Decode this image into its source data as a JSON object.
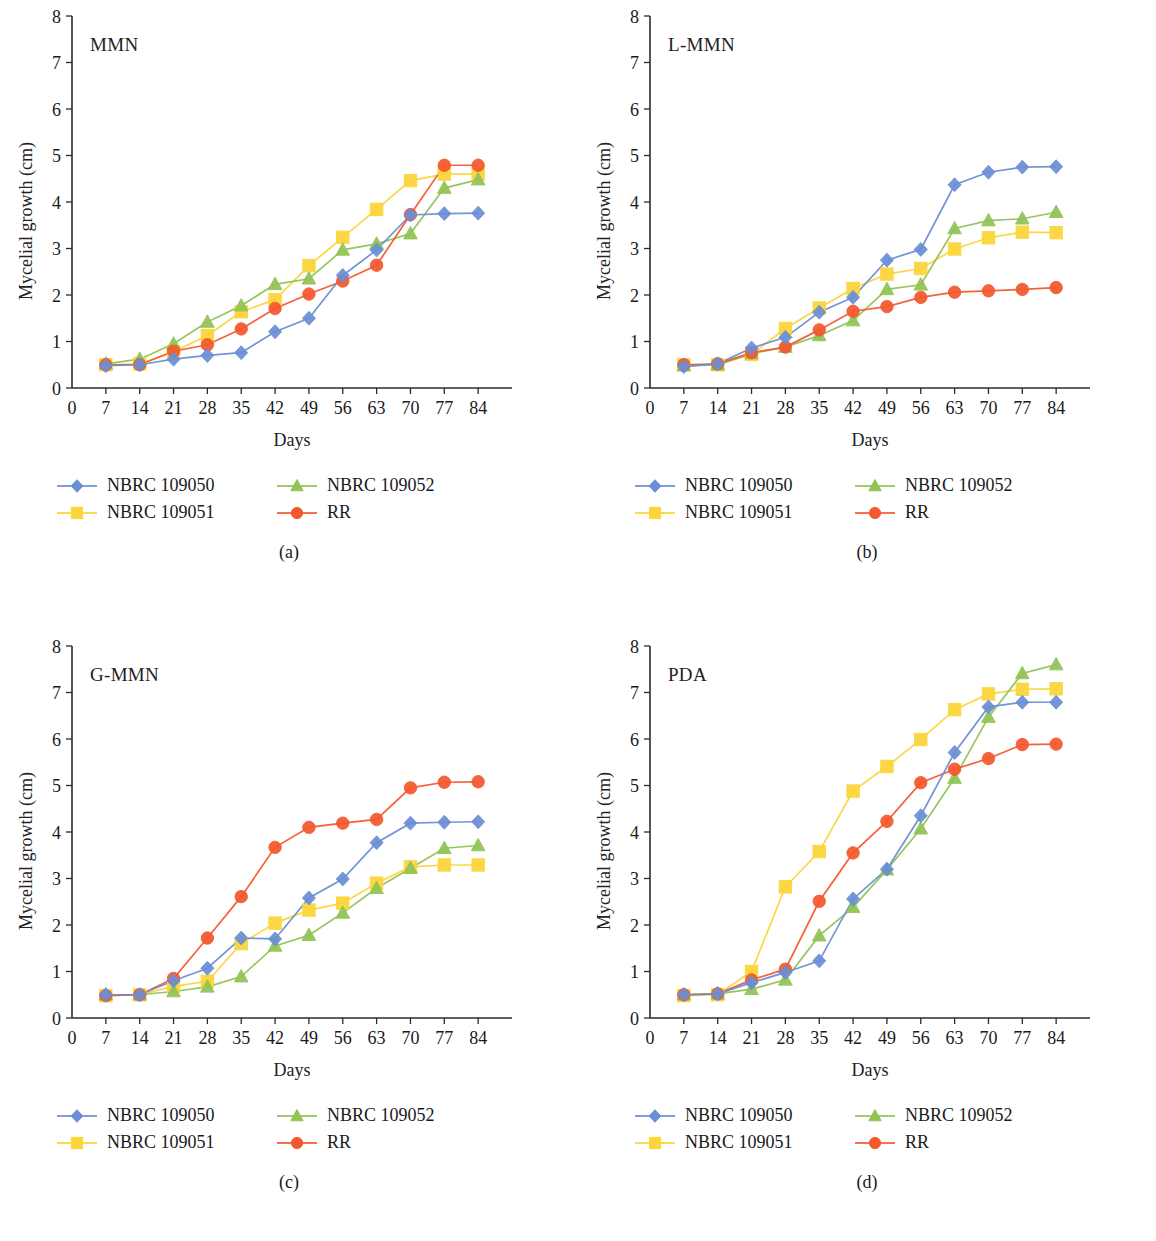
{
  "figure": {
    "axis_titles": {
      "x": "Days",
      "y": "Mycelial growth (cm)"
    },
    "legend_labels": {
      "s0": "NBRC 109050",
      "s1": "NBRC 109051",
      "s2": "NBRC 109052",
      "s3": "RR"
    },
    "colors": {
      "s0": "#6b8fd4",
      "s1": "#fbd539",
      "s2": "#91c355",
      "s3": "#f4582d",
      "axis": "#2b2b2b",
      "text": "#1a1a1a"
    },
    "captions": {
      "a": "(a)",
      "b": "(b)",
      "c": "(c)",
      "d": "(d)"
    }
  },
  "chart_data": [
    {
      "type": "line",
      "panel": "a",
      "title": "MMN",
      "xlabel": "Days",
      "ylabel": "Mycelial growth (cm)",
      "xlim": [
        0,
        91
      ],
      "ylim": [
        0,
        8
      ],
      "xticks": [
        0,
        7,
        14,
        21,
        28,
        35,
        42,
        49,
        56,
        63,
        70,
        77,
        84
      ],
      "yticks": [
        0,
        1,
        2,
        3,
        4,
        5,
        6,
        7,
        8
      ],
      "grid": false,
      "legend_position": "below",
      "x": [
        7,
        14,
        21,
        28,
        35,
        42,
        49,
        56,
        63,
        70,
        77,
        84
      ],
      "series": [
        {
          "name": "NBRC 109050",
          "marker": "diamond",
          "color": "#6b8fd4",
          "values": [
            0.48,
            0.5,
            0.62,
            0.7,
            0.76,
            1.21,
            1.5,
            2.42,
            2.97,
            3.72,
            3.75,
            3.76
          ]
        },
        {
          "name": "NBRC 109051",
          "marker": "square",
          "color": "#fbd539",
          "values": [
            0.5,
            0.52,
            0.78,
            1.13,
            1.64,
            1.9,
            2.63,
            3.24,
            3.84,
            4.46,
            4.6,
            4.6
          ]
        },
        {
          "name": "NBRC 109052",
          "marker": "triangle",
          "color": "#91c355",
          "values": [
            0.52,
            0.62,
            0.95,
            1.42,
            1.77,
            2.23,
            2.35,
            2.97,
            3.1,
            3.32,
            4.3,
            4.48
          ]
        },
        {
          "name": "RR",
          "marker": "circle",
          "color": "#f4582d",
          "values": [
            0.5,
            0.5,
            0.79,
            0.93,
            1.27,
            1.71,
            2.02,
            2.3,
            2.64,
            3.73,
            4.79,
            4.79
          ]
        }
      ]
    },
    {
      "type": "line",
      "panel": "b",
      "title": "L-MMN",
      "xlabel": "Days",
      "ylabel": "Mycelial growth (cm)",
      "xlim": [
        0,
        91
      ],
      "ylim": [
        0,
        8
      ],
      "xticks": [
        0,
        7,
        14,
        21,
        28,
        35,
        42,
        49,
        56,
        63,
        70,
        77,
        84
      ],
      "yticks": [
        0,
        1,
        2,
        3,
        4,
        5,
        6,
        7,
        8
      ],
      "grid": false,
      "legend_position": "below",
      "x": [
        7,
        14,
        21,
        28,
        35,
        42,
        49,
        56,
        63,
        70,
        77,
        84
      ],
      "series": [
        {
          "name": "NBRC 109050",
          "marker": "diamond",
          "color": "#6b8fd4",
          "values": [
            0.46,
            0.52,
            0.86,
            1.09,
            1.63,
            1.95,
            2.75,
            2.98,
            4.37,
            4.64,
            4.75,
            4.76
          ]
        },
        {
          "name": "NBRC 109051",
          "marker": "square",
          "color": "#fbd539",
          "values": [
            0.5,
            0.5,
            0.72,
            1.28,
            1.72,
            2.14,
            2.45,
            2.57,
            2.99,
            3.23,
            3.35,
            3.34
          ]
        },
        {
          "name": "NBRC 109052",
          "marker": "triangle",
          "color": "#91c355",
          "values": [
            0.48,
            0.5,
            0.74,
            0.88,
            1.13,
            1.45,
            2.12,
            2.22,
            3.43,
            3.6,
            3.64,
            3.78
          ]
        },
        {
          "name": "RR",
          "marker": "circle",
          "color": "#f4582d",
          "values": [
            0.5,
            0.52,
            0.76,
            0.88,
            1.25,
            1.65,
            1.75,
            1.95,
            2.06,
            2.09,
            2.12,
            2.16
          ]
        }
      ]
    },
    {
      "type": "line",
      "panel": "c",
      "title": "G-MMN",
      "xlabel": "Days",
      "ylabel": "Mycelial growth (cm)",
      "xlim": [
        0,
        91
      ],
      "ylim": [
        0,
        8
      ],
      "xticks": [
        0,
        7,
        14,
        21,
        28,
        35,
        42,
        49,
        56,
        63,
        70,
        77,
        84
      ],
      "yticks": [
        0,
        1,
        2,
        3,
        4,
        5,
        6,
        7,
        8
      ],
      "grid": false,
      "legend_position": "below",
      "x": [
        7,
        14,
        21,
        28,
        35,
        42,
        49,
        56,
        63,
        70,
        77,
        84
      ],
      "series": [
        {
          "name": "NBRC 109050",
          "marker": "diamond",
          "color": "#6b8fd4",
          "values": [
            0.5,
            0.5,
            0.8,
            1.07,
            1.72,
            1.7,
            2.58,
            2.99,
            3.77,
            4.19,
            4.21,
            4.22
          ]
        },
        {
          "name": "NBRC 109051",
          "marker": "square",
          "color": "#fbd539",
          "values": [
            0.48,
            0.5,
            0.68,
            0.79,
            1.6,
            2.04,
            2.32,
            2.47,
            2.9,
            3.25,
            3.29,
            3.29
          ]
        },
        {
          "name": "NBRC 109052",
          "marker": "triangle",
          "color": "#91c355",
          "values": [
            0.5,
            0.5,
            0.57,
            0.67,
            0.89,
            1.55,
            1.78,
            2.26,
            2.79,
            3.22,
            3.65,
            3.71
          ]
        },
        {
          "name": "RR",
          "marker": "circle",
          "color": "#f4582d",
          "values": [
            0.48,
            0.5,
            0.85,
            1.72,
            2.61,
            3.67,
            4.1,
            4.19,
            4.27,
            4.95,
            5.07,
            5.08
          ]
        }
      ]
    },
    {
      "type": "line",
      "panel": "d",
      "title": "PDA",
      "xlabel": "Days",
      "ylabel": "Mycelial growth (cm)",
      "xlim": [
        0,
        91
      ],
      "ylim": [
        0,
        8
      ],
      "xticks": [
        0,
        7,
        14,
        21,
        28,
        35,
        42,
        49,
        56,
        63,
        70,
        77,
        84
      ],
      "yticks": [
        0,
        1,
        2,
        3,
        4,
        5,
        6,
        7,
        8
      ],
      "grid": false,
      "legend_position": "below",
      "x": [
        7,
        14,
        21,
        28,
        35,
        42,
        49,
        56,
        63,
        70,
        77,
        84
      ],
      "series": [
        {
          "name": "NBRC 109050",
          "marker": "diamond",
          "color": "#6b8fd4",
          "values": [
            0.5,
            0.52,
            0.76,
            0.98,
            1.23,
            2.56,
            3.2,
            4.35,
            5.71,
            6.69,
            6.79,
            6.79
          ]
        },
        {
          "name": "NBRC 109051",
          "marker": "square",
          "color": "#fbd539",
          "values": [
            0.48,
            0.5,
            1.0,
            2.82,
            3.58,
            4.88,
            5.41,
            5.99,
            6.63,
            6.97,
            7.07,
            7.08
          ]
        },
        {
          "name": "NBRC 109052",
          "marker": "triangle",
          "color": "#91c355",
          "values": [
            0.5,
            0.52,
            0.62,
            0.82,
            1.77,
            2.38,
            3.19,
            4.07,
            5.16,
            6.47,
            7.41,
            7.6
          ]
        },
        {
          "name": "RR",
          "marker": "circle",
          "color": "#f4582d",
          "values": [
            0.5,
            0.52,
            0.82,
            1.05,
            2.51,
            3.55,
            4.23,
            5.06,
            5.35,
            5.58,
            5.88,
            5.89
          ]
        }
      ]
    }
  ]
}
